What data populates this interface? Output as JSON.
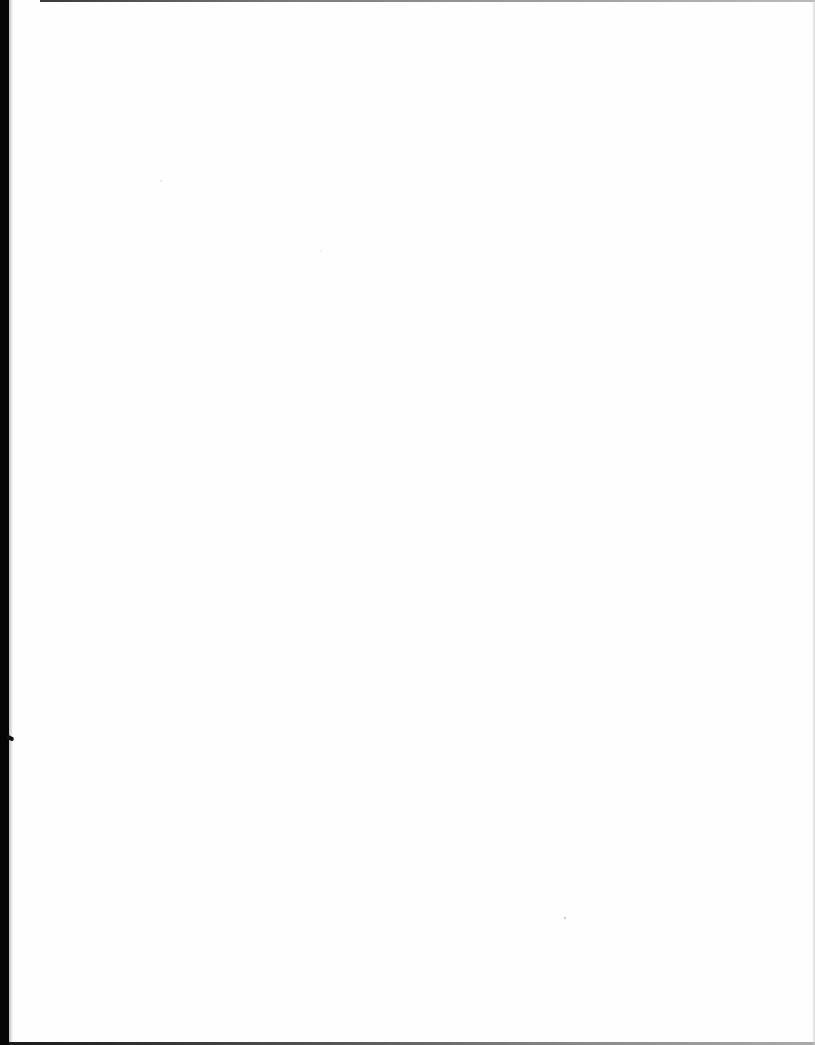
{
  "page": {
    "type": "blank scanned page",
    "text": ""
  },
  "colors": {
    "paper": "#fefefe",
    "scan_edge": "#050505"
  }
}
